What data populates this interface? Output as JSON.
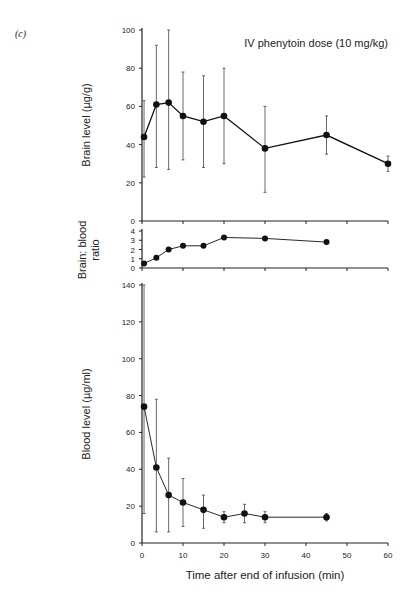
{
  "chart_data": [
    {
      "type": "line",
      "panel": "(c)",
      "title": "IV phenytoin dose (10 mg/kg)",
      "ylabel": "Brain level (µg/g)",
      "xlabel": "",
      "ylim": [
        0,
        100
      ],
      "yticks": [
        "0",
        "20",
        "40",
        "60",
        "80",
        "100"
      ],
      "xlim": [
        0,
        60
      ],
      "grid": false,
      "x": [
        0.5,
        3.5,
        6.5,
        10,
        15,
        20,
        30,
        45,
        60
      ],
      "series": [
        {
          "name": "Brain level",
          "values": [
            44,
            61,
            62,
            55,
            52,
            55,
            38,
            45,
            30
          ],
          "err_low": [
            23,
            28,
            27,
            32,
            28,
            30,
            15,
            35,
            26
          ],
          "err_high": [
            63,
            92,
            100,
            78,
            76,
            80,
            60,
            55,
            34
          ]
        }
      ]
    },
    {
      "type": "line",
      "ylabel": "Brain: blood ratio",
      "ylim": [
        0,
        4
      ],
      "yticks": [
        "0",
        "1",
        "2",
        "3",
        "4"
      ],
      "xlim": [
        0,
        60
      ],
      "grid": false,
      "x": [
        0.5,
        3.5,
        6.5,
        10,
        15,
        20,
        30,
        45
      ],
      "series": [
        {
          "name": "Brain:blood ratio",
          "values": [
            0.5,
            1.1,
            2.0,
            2.4,
            2.4,
            3.3,
            3.2,
            2.8
          ]
        }
      ]
    },
    {
      "type": "line",
      "ylabel": "Blood level (µg/ml)",
      "xlabel": "Time after end of infusion (min)",
      "ylim": [
        0,
        140
      ],
      "yticks": [
        "0",
        "20",
        "40",
        "60",
        "80",
        "100",
        "120",
        "140"
      ],
      "xlim": [
        0,
        60
      ],
      "xticks": [
        "0",
        "10",
        "20",
        "30",
        "40",
        "50",
        "60"
      ],
      "grid": false,
      "x": [
        0.5,
        3.5,
        6.5,
        10,
        15,
        20,
        25,
        30,
        45
      ],
      "series": [
        {
          "name": "Blood level",
          "values": [
            74,
            41,
            26,
            22,
            18,
            14,
            16,
            14,
            14
          ],
          "err_low": [
            16,
            6,
            6,
            9,
            8,
            11,
            11,
            11,
            12
          ],
          "err_high": [
            140,
            78,
            46,
            35,
            26,
            17,
            21,
            17,
            16
          ]
        }
      ]
    }
  ],
  "labels": {
    "panel": "(c)",
    "title": "IV phenytoin dose (10 mg/kg)",
    "brain_ylabel": "Brain level (µg/g)",
    "ratio_ylabel_1": "Brain: blood",
    "ratio_ylabel_2": "ratio",
    "blood_ylabel": "Blood level (µg/ml)",
    "xlabel": "Time after end of infusion (min)"
  }
}
